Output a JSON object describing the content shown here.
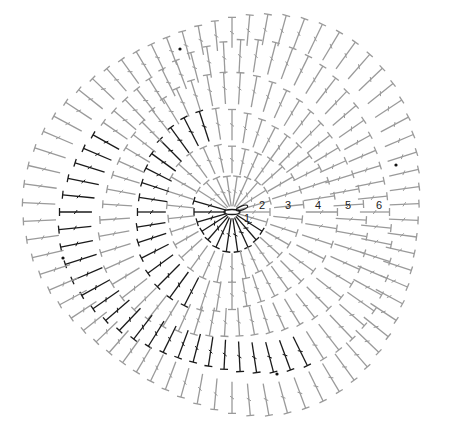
{
  "diagram": {
    "type": "crochet-chart",
    "center": {
      "x": 232,
      "y": 212
    },
    "colors": {
      "dark": "#1a1a1a",
      "light": "#9a9a9a"
    },
    "round_labels": [
      {
        "text": "1",
        "x": 247,
        "y": 222
      },
      {
        "text": "2",
        "x": 262,
        "y": 209
      },
      {
        "text": "3",
        "x": 288,
        "y": 209
      },
      {
        "text": "4",
        "x": 318,
        "y": 209
      },
      {
        "text": "5",
        "x": 348,
        "y": 209
      },
      {
        "text": "6",
        "x": 379,
        "y": 209
      }
    ],
    "rounds": [
      {
        "index": 1,
        "inner": 6,
        "outer": 38,
        "count": 22,
        "color": "dark",
        "arc": [
          150,
          330
        ]
      },
      {
        "index": 2,
        "inner": 40,
        "outer": 68,
        "count": 30,
        "color": "light",
        "arc": [
          0,
          360
        ]
      },
      {
        "index": 3,
        "inner": 70,
        "outer": 100,
        "count": 40,
        "color": "dark",
        "arc": [
          100,
          250
        ]
      },
      {
        "index": 4,
        "inner": 102,
        "outer": 132,
        "count": 52,
        "color": "light",
        "arc": [
          0,
          360
        ]
      },
      {
        "index": 5,
        "inner": 134,
        "outer": 165,
        "count": 62,
        "color": "dark",
        "arc": [
          150,
          300
        ]
      },
      {
        "index": 6,
        "inner": 167,
        "outer": 198,
        "count": 70,
        "color": "light",
        "arc": [
          0,
          360
        ]
      }
    ],
    "markers": [
      {
        "x": 180,
        "y": 49
      },
      {
        "x": 396,
        "y": 165
      },
      {
        "x": 63,
        "y": 258
      },
      {
        "x": 277,
        "y": 374
      }
    ]
  }
}
